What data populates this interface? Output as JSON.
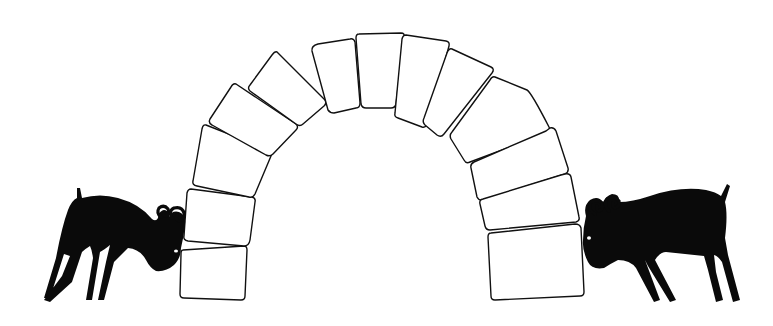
{
  "scene": {
    "description": "Two black goats butting heads against opposite feet of a stone arch",
    "background": "#ffffff",
    "ink": "#0a0a0a",
    "arch": {
      "stone_count": 16,
      "stones": [
        "M183,250 L244,246 Q247,246 247,250 L245,296 Q245,300 241,300 L184,298 Q180,298 180,294 L181,254 Q181,250 183,250 Z",
        "M191,189 L252,197 Q256,198 255,202 L250,240 Q249,246 244,246 L188,241 Q183,240 184,236 L187,193 Q188,189 191,189 Z",
        "M206,125 L269,150 Q273,152 271,156 L255,194 Q253,198 249,197 L197,186 Q192,185 193,181 L202,129 Q203,124 206,125 Z",
        "M236,84 L296,124 Q299,127 296,130 L273,154 Q270,157 266,155 L212,125 Q208,123 210,119 L231,87 Q233,83 236,84 Z",
        "M277,52 L325,100 Q327,103 324,106 L303,124 Q300,127 296,124 L250,91 Q247,88 250,85 L272,55 Q275,51 277,52 Z",
        "M318,44 L350,39 Q354,38 355,42 L360,103 Q360,108 356,108 L334,113 Q330,113 328,110 L312,51 Q311,46 318,44 Z",
        "M359,34 L401,33 Q405,33 404,37 L396,104 Q395,108 391,108 L366,108 Q362,108 361,104 L356,38 Q356,34 359,34 Z",
        "M406,35 L446,41 Q450,42 449,46 L428,123 Q426,128 422,127 L398,118 Q394,117 395,113 L402,39 Q403,35 406,35 Z",
        "M452,49 L491,67 Q495,69 492,73 L444,134 Q441,138 437,135 L425,125 Q422,122 424,118 L447,53 Q449,48 452,49 Z",
        "M495,77 L527,90 Q531,92 549,127 Q551,131 547,133 L470,162 Q466,164 464,160 L451,139 Q449,135 452,132 L490,80 Q492,76 495,77 Z",
        "M550,128 Q554,127 556,131 L568,168 Q569,172 565,174 L483,200 Q479,201 477,197 L471,168 Q470,164 474,162 L546,131 Z",
        "M565,174 Q570,173 571,177 L579,217 Q580,221 576,222 L490,230 Q486,230 485,226 L480,204 Q479,200 483,199 L561,175 Z",
        "M491,233 L575,224 Q580,224 581,228 L584,292 Q584,296 580,296 L495,300 Q491,300 491,296 L488,237 Q488,233 491,233 Z"
      ]
    },
    "goats": [
      {
        "side": "left",
        "facing": "right",
        "body_path": "M77,188 L80,188 L82,198 Q100,193 118,198 Q140,204 152,219 Q156,222 158,218 Q159,210 165,210 Q170,212 169,217 Q172,210 179,212 Q186,215 185,224 Q184,236 181,248 Q181,258 174,265 Q166,272 156,271 Q150,268 146,260 Q140,249 128,248 L114,262 L104,300 L98,300 L106,262 L110,245 Q104,250 100,252 L92,300 L86,300 L93,258 Q92,250 90,246 Q85,249 82,252 L72,282 L50,302 L44,300 L62,276 L70,256 L64,254 L50,298 L44,298 L56,258 Q62,226 68,210 Q72,200 77,198 Z",
        "eye": {
          "cx": 176,
          "cy": 251,
          "rx": 2,
          "ry": 1.5
        },
        "horns": [
          "M161,217 Q156,213 159,208 Q164,204 168,209 Q170,214 166,216 Q163,216 164,212",
          "M172,218 Q168,211 174,208 Q182,206 184,213 Q185,220 179,221 Q175,220 177,215"
        ]
      },
      {
        "side": "right",
        "facing": "left",
        "body_path": "M727,184 L730,186 L725,202 Q728,214 725,238 L728,255 L740,300 L733,302 L722,262 Q718,256 714,255 L716,272 L723,300 L716,302 L708,270 L704,256 L666,252 Q660,252 655,260 L676,300 L670,302 L648,266 L645,260 L660,300 L654,302 L636,268 Q630,260 618,260 Q610,264 604,268 Q592,270 588,262 Q582,250 583,240 Q583,228 586,216 Q583,206 590,200 Q598,195 603,202 Q606,196 612,194 Q620,194 619,202 Q632,202 650,196 Q680,186 706,190 Q716,192 721,196 Z",
        "eye": {
          "cx": 589,
          "cy": 238,
          "rx": 2,
          "ry": 1.8
        },
        "horns": [
          "M595,214 Q588,210 590,203 Q596,198 602,203 Q604,209 599,211 Q596,210 597,206",
          "M609,211 Q603,205 607,199 Q614,195 619,201 Q620,207 615,208 Q612,207 613,203"
        ]
      }
    ]
  }
}
